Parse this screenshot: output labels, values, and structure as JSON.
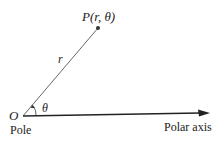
{
  "diagram": {
    "point_label": "P(r, θ)",
    "radius_label": "r",
    "angle_label": "θ",
    "origin_label": "O",
    "pole_label": "Pole",
    "axis_label": "Polar axis",
    "colors": {
      "line": "#333333",
      "text": "#222222",
      "background": "#ffffff"
    }
  }
}
